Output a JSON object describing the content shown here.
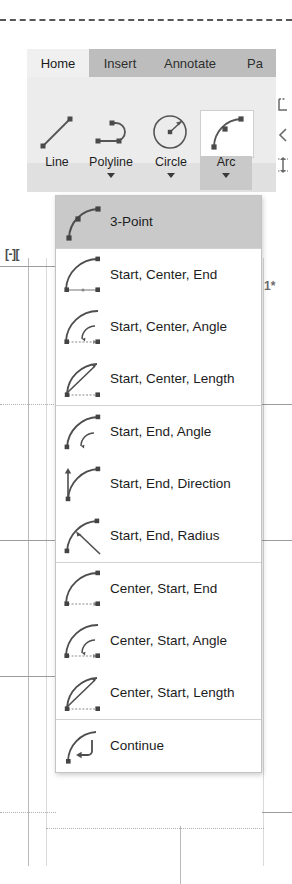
{
  "app": {
    "name": "AutoCAD Arc dropdown",
    "viewport_label": "[-][",
    "grid_marker": "1*"
  },
  "ribbon": {
    "tabs": [
      {
        "label": "Home",
        "active": true
      },
      {
        "label": "Insert",
        "active": false
      },
      {
        "label": "Annotate",
        "active": false
      },
      {
        "label": "Pa",
        "active": false
      }
    ],
    "panel_name": "Draw",
    "tools": [
      {
        "label": "Line",
        "icon": "line-icon",
        "has_caret": false,
        "active": false
      },
      {
        "label": "Polyline",
        "icon": "polyline-icon",
        "has_caret": true,
        "active": false
      },
      {
        "label": "Circle",
        "icon": "circle-icon",
        "has_caret": true,
        "active": false
      },
      {
        "label": "Arc",
        "icon": "arc-icon",
        "has_caret": true,
        "active": true
      }
    ],
    "side_icons": [
      {
        "name": "text-style-icon"
      },
      {
        "name": "leader-icon"
      },
      {
        "name": "dimension-icon"
      }
    ]
  },
  "arc_menu": {
    "title": "Arc",
    "selected": "3-Point",
    "groups": [
      {
        "items": [
          {
            "label": "3-Point",
            "icon": "arc-3point-icon",
            "selected": true
          }
        ]
      },
      {
        "items": [
          {
            "label": "Start, Center, End",
            "icon": "arc-start-center-end-icon",
            "selected": false
          },
          {
            "label": "Start, Center, Angle",
            "icon": "arc-start-center-angle-icon",
            "selected": false
          },
          {
            "label": "Start, Center, Length",
            "icon": "arc-start-center-length-icon",
            "selected": false
          }
        ]
      },
      {
        "items": [
          {
            "label": "Start, End, Angle",
            "icon": "arc-start-end-angle-icon",
            "selected": false
          },
          {
            "label": "Start, End, Direction",
            "icon": "arc-start-end-direction-icon",
            "selected": false
          },
          {
            "label": "Start, End, Radius",
            "icon": "arc-start-end-radius-icon",
            "selected": false
          }
        ]
      },
      {
        "items": [
          {
            "label": "Center, Start, End",
            "icon": "arc-center-start-end-icon",
            "selected": false
          },
          {
            "label": "Center, Start, Angle",
            "icon": "arc-center-start-angle-icon",
            "selected": false
          },
          {
            "label": "Center, Start, Length",
            "icon": "arc-center-start-length-icon",
            "selected": false
          }
        ]
      },
      {
        "items": [
          {
            "label": "Continue",
            "icon": "arc-continue-icon",
            "selected": false
          }
        ]
      }
    ]
  },
  "colors": {
    "ribbon_tabbar": "#bdbdbd",
    "ribbon_panel": "#ececec",
    "tab_active_bg": "#f0f0f0",
    "menu_bg": "#ffffff",
    "menu_border": "#c4c4c4",
    "highlight": "#c9c9c9",
    "separator": "#d2d2d2",
    "icon_stroke": "#555555",
    "node_marker": "#4a4a4a",
    "text": "#1c1c1c"
  }
}
